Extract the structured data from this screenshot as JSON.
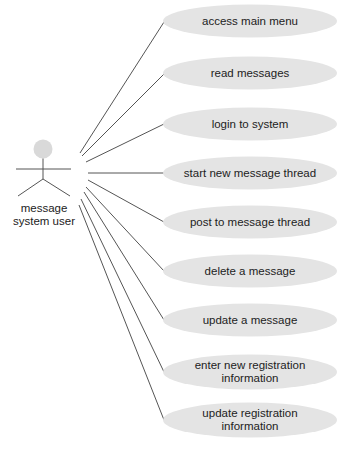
{
  "diagram": {
    "type": "uml-use-case",
    "colors": {
      "background": "#ffffff",
      "ellipse_fill": "#e4e4e4",
      "actor_head_fill": "#d9d9d9",
      "line": "#555555",
      "text": "#222222"
    },
    "actor": {
      "label_lines": [
        "message",
        "system user"
      ]
    },
    "use_cases": [
      {
        "id": "uc1",
        "lines": [
          "access main menu"
        ]
      },
      {
        "id": "uc2",
        "lines": [
          "read messages"
        ]
      },
      {
        "id": "uc3",
        "lines": [
          "login to system"
        ]
      },
      {
        "id": "uc4",
        "lines": [
          "start new message thread"
        ]
      },
      {
        "id": "uc5",
        "lines": [
          "post to message thread"
        ]
      },
      {
        "id": "uc6",
        "lines": [
          "delete a message"
        ]
      },
      {
        "id": "uc7",
        "lines": [
          "update a message"
        ]
      },
      {
        "id": "uc8",
        "lines": [
          "enter new registration",
          "information"
        ]
      },
      {
        "id": "uc9",
        "lines": [
          "update registration",
          "information"
        ]
      }
    ]
  }
}
